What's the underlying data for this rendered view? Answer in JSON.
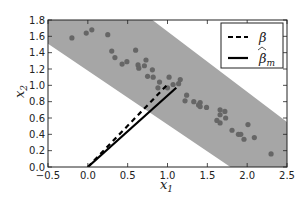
{
  "chart_data": {
    "type": "scatter",
    "title": "",
    "xlabel": "x1",
    "ylabel": "x2",
    "xlim": [
      -0.5,
      2.5
    ],
    "ylim": [
      0.0,
      1.8
    ],
    "grid": false,
    "legend_position": "upper right",
    "xticks": [
      -0.5,
      0.0,
      0.5,
      1.0,
      1.5,
      2.0,
      2.5
    ],
    "xtick_labels": [
      "−0.5",
      "0.0",
      "0.5",
      "1.0",
      "1.5",
      "2.0",
      "2.5"
    ],
    "yticks": [
      0.0,
      0.2,
      0.4,
      0.6,
      0.8,
      1.0,
      1.2,
      1.4,
      1.6,
      1.8
    ],
    "ytick_labels": [
      "0.0",
      "0.2",
      "0.4",
      "0.6",
      "0.8",
      "1.0",
      "1.2",
      "1.4",
      "1.6",
      "1.8"
    ],
    "band": {
      "description": "shaded gray band of points with slope ~ -0.55",
      "color": "#a6a6a6",
      "upper_edge": [
        [
          -0.5,
          2.67
        ],
        [
          0.81,
          1.8
        ],
        [
          2.5,
          0.55
        ]
      ],
      "lower_edge": [
        [
          -0.5,
          1.51
        ],
        [
          1.79,
          0.0
        ]
      ]
    },
    "series": [
      {
        "name": "points",
        "kind": "scatter",
        "color": "#666666",
        "points": [
          [
            -0.2,
            1.58
          ],
          [
            -0.02,
            1.64
          ],
          [
            0.05,
            1.68
          ],
          [
            0.25,
            1.62
          ],
          [
            0.3,
            1.42
          ],
          [
            0.34,
            1.34
          ],
          [
            0.43,
            1.26
          ],
          [
            0.49,
            1.29
          ],
          [
            0.6,
            1.43
          ],
          [
            0.73,
            1.31
          ],
          [
            0.63,
            1.25
          ],
          [
            0.64,
            1.21
          ],
          [
            0.71,
            1.24
          ],
          [
            0.81,
            1.19
          ],
          [
            0.75,
            1.11
          ],
          [
            0.82,
            1.1
          ],
          [
            0.9,
            1.04
          ],
          [
            1.02,
            1.1
          ],
          [
            1.16,
            1.07
          ],
          [
            1.14,
            1.02
          ],
          [
            0.88,
            0.97
          ],
          [
            1.0,
            0.97
          ],
          [
            1.07,
            1.01
          ],
          [
            1.24,
            0.88
          ],
          [
            1.22,
            0.81
          ],
          [
            1.33,
            0.8
          ],
          [
            1.41,
            0.79
          ],
          [
            1.39,
            0.76
          ],
          [
            1.41,
            0.74
          ],
          [
            1.49,
            0.73
          ],
          [
            1.66,
            0.7
          ],
          [
            1.72,
            0.68
          ],
          [
            1.66,
            0.64
          ],
          [
            1.73,
            0.6
          ],
          [
            1.62,
            0.57
          ],
          [
            1.66,
            0.54
          ],
          [
            1.81,
            0.45
          ],
          [
            1.89,
            0.4
          ],
          [
            1.92,
            0.4
          ],
          [
            1.96,
            0.34
          ],
          [
            2.01,
            0.52
          ],
          [
            2.09,
            0.36
          ],
          [
            2.3,
            0.16
          ]
        ]
      },
      {
        "name": "β",
        "kind": "line",
        "style": "dashed",
        "color": "#000000",
        "x": [
          0.0,
          1.01
        ],
        "y": [
          0.0,
          1.02
        ]
      },
      {
        "name": "β̂_m",
        "kind": "line",
        "style": "solid",
        "color": "#000000",
        "x": [
          0.0,
          1.11
        ],
        "y": [
          0.0,
          0.97
        ]
      }
    ],
    "legend": [
      {
        "label": "β",
        "style": "dashed"
      },
      {
        "label": "β̂",
        "subscript": "m",
        "style": "solid"
      }
    ]
  },
  "labels": {
    "x_main": "x",
    "x_sub": "1",
    "y_main": "x",
    "y_sub": "2",
    "legend_beta": "β",
    "legend_betahat": "β",
    "legend_betahat_hat": "̂",
    "legend_betahat_sub": "m"
  }
}
